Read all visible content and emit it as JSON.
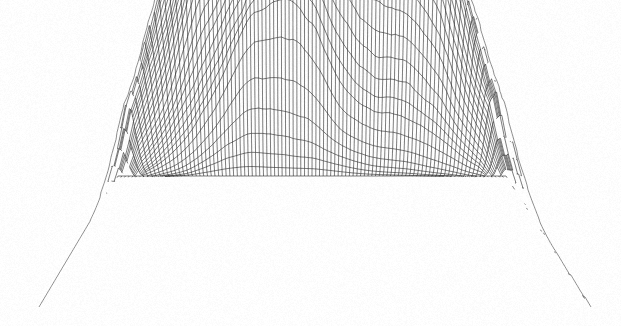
{
  "figure": {
    "title": "",
    "caption": "",
    "background_color": "#fefefe",
    "line_color": "#1a1a1a",
    "width_px": 621,
    "height_px": 326
  },
  "chart_data": {
    "type": "surface",
    "render_style": "wireframe-mesh",
    "title": "",
    "subtitle": "",
    "xlabel": "",
    "ylabel": "",
    "zlabel": "",
    "grid": true,
    "legend": "none",
    "axes_visible": false,
    "tick_labels": [],
    "annotations": [],
    "projection": {
      "type": "oblique-parallel",
      "azimuth_deg": 235,
      "elevation_deg": 28,
      "vertical_exaggeration": 1.0
    },
    "mesh": {
      "rows": 78,
      "cols": 104,
      "cell_px": 5.5,
      "hidden_line_removal": true
    },
    "footprint_px": {
      "front_left": [
        40,
        307
      ],
      "front_right": [
        590,
        307
      ],
      "back_left": [
        118,
        176
      ],
      "back_right": [
        506,
        176
      ]
    },
    "xlim": [
      0,
      1
    ],
    "ylim": [
      0,
      1
    ],
    "zlim": [
      0,
      1
    ],
    "features": [
      {
        "name": "main-peak",
        "label": "primary summit",
        "screen_px": [
          236,
          26
        ],
        "u": 0.42,
        "v": 0.7,
        "height": 1.0,
        "sigma": 0.15,
        "roughness": 0.55
      },
      {
        "name": "secondary-peak",
        "label": "secondary summit",
        "screen_px": [
          452,
          74
        ],
        "u": 0.76,
        "v": 0.74,
        "height": 0.74,
        "sigma": 0.095,
        "roughness": 0.42
      },
      {
        "name": "saddle",
        "label": "col between summits",
        "screen_px": [
          376,
          96
        ],
        "u": 0.63,
        "v": 0.7,
        "height": 0.5,
        "sigma": 0.09,
        "roughness": 0.3
      },
      {
        "name": "front-spur",
        "label": "central frontal spur",
        "screen_px": [
          300,
          170
        ],
        "u": 0.46,
        "v": 0.36,
        "height": 0.47,
        "sigma": 0.22,
        "roughness": 0.08
      },
      {
        "name": "left-shoulder",
        "label": "western shoulder ridge",
        "screen_px": [
          170,
          110
        ],
        "u": 0.31,
        "v": 0.66,
        "height": 0.66,
        "sigma": 0.12,
        "roughness": 0.6
      },
      {
        "name": "right-flank",
        "label": "eastern flank",
        "screen_px": [
          500,
          160
        ],
        "u": 0.86,
        "v": 0.56,
        "height": 0.33,
        "sigma": 0.16,
        "roughness": 0.22
      },
      {
        "name": "rear-left-rise",
        "label": "north-west rise",
        "screen_px": [
          150,
          150
        ],
        "u": 0.22,
        "v": 0.52,
        "height": 0.34,
        "sigma": 0.14,
        "roughness": 0.35
      },
      {
        "name": "valley-floor",
        "label": "foreground basin",
        "screen_px": [
          330,
          290
        ],
        "u": 0.52,
        "v": 0.06,
        "height": 0.02,
        "sigma": 0.3,
        "roughness": 0.03
      }
    ],
    "ridges": [
      {
        "name": "main-diagonal-ridge",
        "label": "south-east descending ridge",
        "from_px": [
          300,
          100
        ],
        "to_px": [
          540,
          230
        ]
      },
      {
        "name": "west-ridge",
        "label": "west descending ridge",
        "from_px": [
          225,
          40
        ],
        "to_px": [
          95,
          230
        ]
      }
    ],
    "noise": {
      "octaves": 6,
      "base_frequency": 3.0,
      "persistence": 0.52,
      "lacunarity": 2.05,
      "amplitude": 0.21,
      "seed": 20240917
    }
  }
}
